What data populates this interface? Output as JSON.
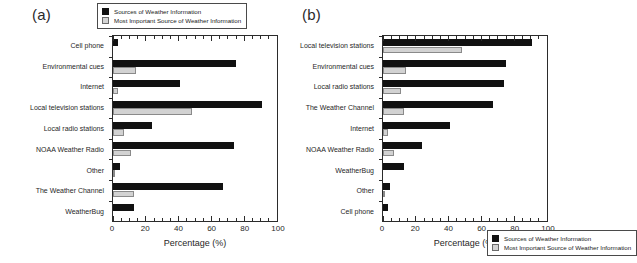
{
  "figure": {
    "panels": [
      {
        "tag": "(a)",
        "legend_position": "above-plot-outside",
        "xlabel": "Percentage (%)",
        "xticks": [
          0,
          20,
          40,
          60,
          80,
          100
        ]
      },
      {
        "tag": "(b)",
        "legend_position": "inside-plot-bottom",
        "xlabel": "Percentage (%)",
        "xticks": [
          0,
          20,
          40,
          60,
          80,
          100
        ]
      }
    ],
    "legend": {
      "entries": [
        {
          "label": "Sources of Weather Information",
          "color": "#111111",
          "swatch": "dark-square-icon"
        },
        {
          "label": "Most Important Source of Weather Information",
          "color": "#d2d2d2",
          "swatch": "light-square-icon"
        }
      ]
    }
  },
  "chart_data": [
    {
      "type": "bar",
      "orientation": "horizontal",
      "title": "(a)",
      "xlabel": "Percentage (%)",
      "ylabel": "",
      "xlim": [
        0,
        100
      ],
      "xticks": [
        0,
        20,
        40,
        60,
        80,
        100
      ],
      "minor_tick_interval": 5,
      "grid": false,
      "legend_position": "above plot, outside axes",
      "categories": [
        "Cell phone",
        "Environmental cues",
        "Internet",
        "Local television stations",
        "Local radio stations",
        "NOAA Weather Radio",
        "Other",
        "The Weather Channel",
        "WeatherBug"
      ],
      "series": [
        {
          "name": "Sources of Weather Information",
          "color": "#111111",
          "values": [
            3,
            75,
            41,
            91,
            24,
            74,
            4,
            67,
            13
          ]
        },
        {
          "name": "Most Important Source of Weather Information",
          "color": "#d2d2d2",
          "values": [
            0,
            14,
            3,
            48,
            7,
            11,
            0.5,
            13,
            0
          ]
        }
      ]
    },
    {
      "type": "bar",
      "orientation": "horizontal",
      "title": "(b)",
      "xlabel": "Percentage (%)",
      "ylabel": "",
      "xlim": [
        0,
        100
      ],
      "xticks": [
        0,
        20,
        40,
        60,
        80,
        100
      ],
      "minor_tick_interval": 5,
      "grid": false,
      "legend_position": "inside plot, lower area",
      "categories": [
        "Local television stations",
        "Environmental cues",
        "Local radio stations",
        "The Weather Channel",
        "Internet",
        "NOAA Weather Radio",
        "WeatherBug",
        "Other",
        "Cell phone"
      ],
      "series": [
        {
          "name": "Sources of Weather Information",
          "color": "#111111",
          "values": [
            91,
            75,
            74,
            67,
            41,
            24,
            13,
            4,
            3
          ]
        },
        {
          "name": "Most Important Source of Weather Information",
          "color": "#d2d2d2",
          "values": [
            48,
            14,
            11,
            13,
            3,
            7,
            0,
            0.5,
            0
          ]
        }
      ]
    }
  ]
}
